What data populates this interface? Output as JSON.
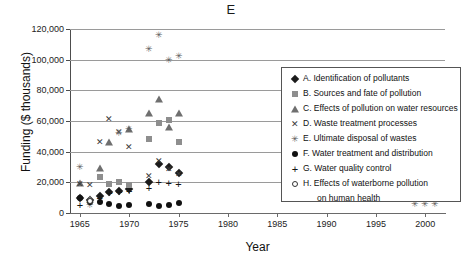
{
  "chart_data": {
    "type": "scatter",
    "title": "E",
    "xlabel": "Year",
    "ylabel": "Funding ($ thousands)",
    "xlim": [
      1964,
      2002
    ],
    "ylim": [
      0,
      120000
    ],
    "xticks": [
      1965,
      1970,
      1975,
      1980,
      1985,
      1990,
      1995,
      2000
    ],
    "xtick_labels": [
      "1965",
      "1970",
      "1975",
      "1980",
      "1985",
      "1990",
      "1995",
      "2000"
    ],
    "yticks": [
      0,
      20000,
      40000,
      60000,
      80000,
      100000,
      120000
    ],
    "ytick_labels": [
      "0",
      "20,000",
      "40,000",
      "60,000",
      "80,000",
      "100,000",
      "120,000"
    ],
    "grid": "horizontal",
    "legend_position": "inside-upper-right",
    "series": [
      {
        "key": "A",
        "name": "A. Identification of pollutants",
        "marker": "diamond",
        "points": [
          {
            "x": 1965,
            "y": 10000
          },
          {
            "x": 1966,
            "y": 8500
          },
          {
            "x": 1967,
            "y": 11000
          },
          {
            "x": 1968,
            "y": 13500
          },
          {
            "x": 1969,
            "y": 14500
          },
          {
            "x": 1970,
            "y": 15500
          },
          {
            "x": 1972,
            "y": 20000
          },
          {
            "x": 1973,
            "y": 32000
          },
          {
            "x": 1974,
            "y": 30000
          },
          {
            "x": 1975,
            "y": 26000
          },
          {
            "x": 1999,
            "y": 31000
          },
          {
            "x": 2000,
            "y": 30500
          },
          {
            "x": 2001,
            "y": 36000
          }
        ]
      },
      {
        "key": "B",
        "name": "B. Sources and fate of pollution",
        "marker": "square",
        "points": [
          {
            "x": 1967,
            "y": 23500
          },
          {
            "x": 1968,
            "y": 19000
          },
          {
            "x": 1969,
            "y": 20000
          },
          {
            "x": 1970,
            "y": 18000
          },
          {
            "x": 1972,
            "y": 48500
          },
          {
            "x": 1973,
            "y": 58500
          },
          {
            "x": 1974,
            "y": 60500
          },
          {
            "x": 1975,
            "y": 46000
          },
          {
            "x": 1999,
            "y": 67500
          },
          {
            "x": 2000,
            "y": 63000
          },
          {
            "x": 2001,
            "y": 67500
          }
        ]
      },
      {
        "key": "C",
        "name": "C. Effects of pollution on water resources",
        "marker": "triangle",
        "points": [
          {
            "x": 1965,
            "y": 19500
          },
          {
            "x": 1966,
            "y": 9000
          },
          {
            "x": 1967,
            "y": 29500
          },
          {
            "x": 1968,
            "y": 46500
          },
          {
            "x": 1970,
            "y": 55000
          },
          {
            "x": 1972,
            "y": 65000
          },
          {
            "x": 1973,
            "y": 74500
          },
          {
            "x": 1974,
            "y": 56000
          },
          {
            "x": 1975,
            "y": 65500
          },
          {
            "x": 1999,
            "y": 34500
          },
          {
            "x": 2000,
            "y": 33000
          },
          {
            "x": 2001,
            "y": 32000
          }
        ]
      },
      {
        "key": "D",
        "name": "D. Waste treatment processes",
        "marker": "x",
        "points": [
          {
            "x": 1965,
            "y": 19000
          },
          {
            "x": 1966,
            "y": 18500
          },
          {
            "x": 1967,
            "y": 46500
          },
          {
            "x": 1968,
            "y": 61500
          },
          {
            "x": 1969,
            "y": 53000
          },
          {
            "x": 1970,
            "y": 43000
          },
          {
            "x": 1972,
            "y": 24000
          },
          {
            "x": 1973,
            "y": 34000
          },
          {
            "x": 1974,
            "y": 29000
          },
          {
            "x": 1975,
            "y": 25500
          },
          {
            "x": 1999,
            "y": 26000
          },
          {
            "x": 2000,
            "y": 26000
          },
          {
            "x": 2001,
            "y": 27500
          }
        ]
      },
      {
        "key": "E",
        "name": "E. Ultimate disposal of wastes",
        "marker": "star-x",
        "points": [
          {
            "x": 1965,
            "y": 30000
          },
          {
            "x": 1966,
            "y": 5500
          },
          {
            "x": 1969,
            "y": 52500
          },
          {
            "x": 1970,
            "y": 54500
          },
          {
            "x": 1972,
            "y": 107000
          },
          {
            "x": 1973,
            "y": 116000
          },
          {
            "x": 1974,
            "y": 99500
          },
          {
            "x": 1975,
            "y": 102500
          },
          {
            "x": 1999,
            "y": 6000
          },
          {
            "x": 2000,
            "y": 6000
          },
          {
            "x": 2001,
            "y": 6000
          }
        ]
      },
      {
        "key": "F",
        "name": "F. Water treatment and distribution",
        "marker": "circle",
        "points": [
          {
            "x": 1965,
            "y": 10000
          },
          {
            "x": 1966,
            "y": 7500
          },
          {
            "x": 1967,
            "y": 7000
          },
          {
            "x": 1968,
            "y": 6000
          },
          {
            "x": 1969,
            "y": 4500
          },
          {
            "x": 1970,
            "y": 5000
          },
          {
            "x": 1972,
            "y": 6000
          },
          {
            "x": 1973,
            "y": 4500
          },
          {
            "x": 1974,
            "y": 5000
          },
          {
            "x": 1975,
            "y": 6500
          },
          {
            "x": 1999,
            "y": 12000
          },
          {
            "x": 2000,
            "y": 14000
          },
          {
            "x": 2001,
            "y": 13500
          }
        ]
      },
      {
        "key": "G",
        "name": "G. Water quality control",
        "marker": "plus",
        "points": [
          {
            "x": 1965,
            "y": 5000
          },
          {
            "x": 1966,
            "y": 7000
          },
          {
            "x": 1967,
            "y": 9500
          },
          {
            "x": 1968,
            "y": 13000
          },
          {
            "x": 1969,
            "y": 14000
          },
          {
            "x": 1970,
            "y": 14500
          },
          {
            "x": 1972,
            "y": 16000
          },
          {
            "x": 1973,
            "y": 20500
          },
          {
            "x": 1974,
            "y": 19500
          },
          {
            "x": 1975,
            "y": 19000
          },
          {
            "x": 1999,
            "y": 20000
          },
          {
            "x": 2000,
            "y": 20000
          },
          {
            "x": 2001,
            "y": 20000
          }
        ]
      },
      {
        "key": "H",
        "name": "H. Effects of waterborne pollution",
        "name_line2": "on human health",
        "marker": "open-circle",
        "points": [
          {
            "x": 1966,
            "y": 8000
          },
          {
            "x": 1999,
            "y": 12500
          },
          {
            "x": 2001,
            "y": 19500
          }
        ]
      }
    ]
  }
}
